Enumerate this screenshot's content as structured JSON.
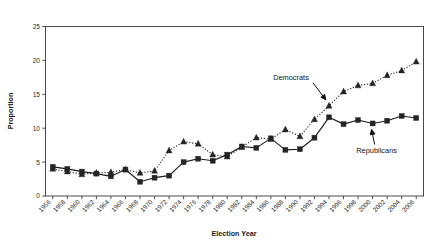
{
  "chart_data": {
    "type": "line",
    "title": "",
    "xlabel": "Election Year",
    "ylabel": "Proportion",
    "ylim": [
      0,
      25
    ],
    "yticks": [
      0,
      5,
      10,
      15,
      20,
      25
    ],
    "grid": false,
    "legend_position": "inline-annotations",
    "categories": [
      "1956",
      "1958",
      "1960",
      "1962",
      "1964",
      "1966",
      "1968",
      "1970",
      "1972",
      "1974",
      "1976",
      "1978",
      "1980",
      "1982",
      "1984",
      "1986",
      "1988",
      "1990",
      "1992",
      "1994",
      "1996",
      "1998",
      "2000",
      "2002",
      "2004",
      "2006"
    ],
    "series": [
      {
        "name": "Democrats",
        "marker": "triangle",
        "linestyle": "dotted",
        "values": [
          4.0,
          3.6,
          3.2,
          3.4,
          3.5,
          3.9,
          3.4,
          3.7,
          6.7,
          8.0,
          7.7,
          6.1,
          5.8,
          7.2,
          8.6,
          8.4,
          9.8,
          8.8,
          11.3,
          13.3,
          15.4,
          16.3,
          16.6,
          17.8,
          18.5,
          19.8
        ]
      },
      {
        "name": "Republicans",
        "marker": "square",
        "linestyle": "solid",
        "values": [
          4.3,
          4.0,
          3.6,
          3.3,
          2.9,
          3.9,
          2.1,
          2.7,
          3.0,
          5.0,
          5.5,
          5.2,
          6.1,
          7.3,
          7.1,
          8.5,
          6.8,
          6.9,
          8.6,
          11.6,
          10.6,
          11.2,
          10.7,
          11.1,
          11.8,
          11.5
        ]
      }
    ],
    "annotations": [
      {
        "text": "Democrats",
        "series": "Democrats",
        "points_to_year": "1994"
      },
      {
        "text": "Republicans",
        "series": "Republicans",
        "points_to_year": "2000"
      }
    ],
    "colors": {
      "series_marker": "#242424",
      "axis": "#4a4a4a",
      "background": "#ffffff",
      "text": "#1a1a1a"
    }
  }
}
